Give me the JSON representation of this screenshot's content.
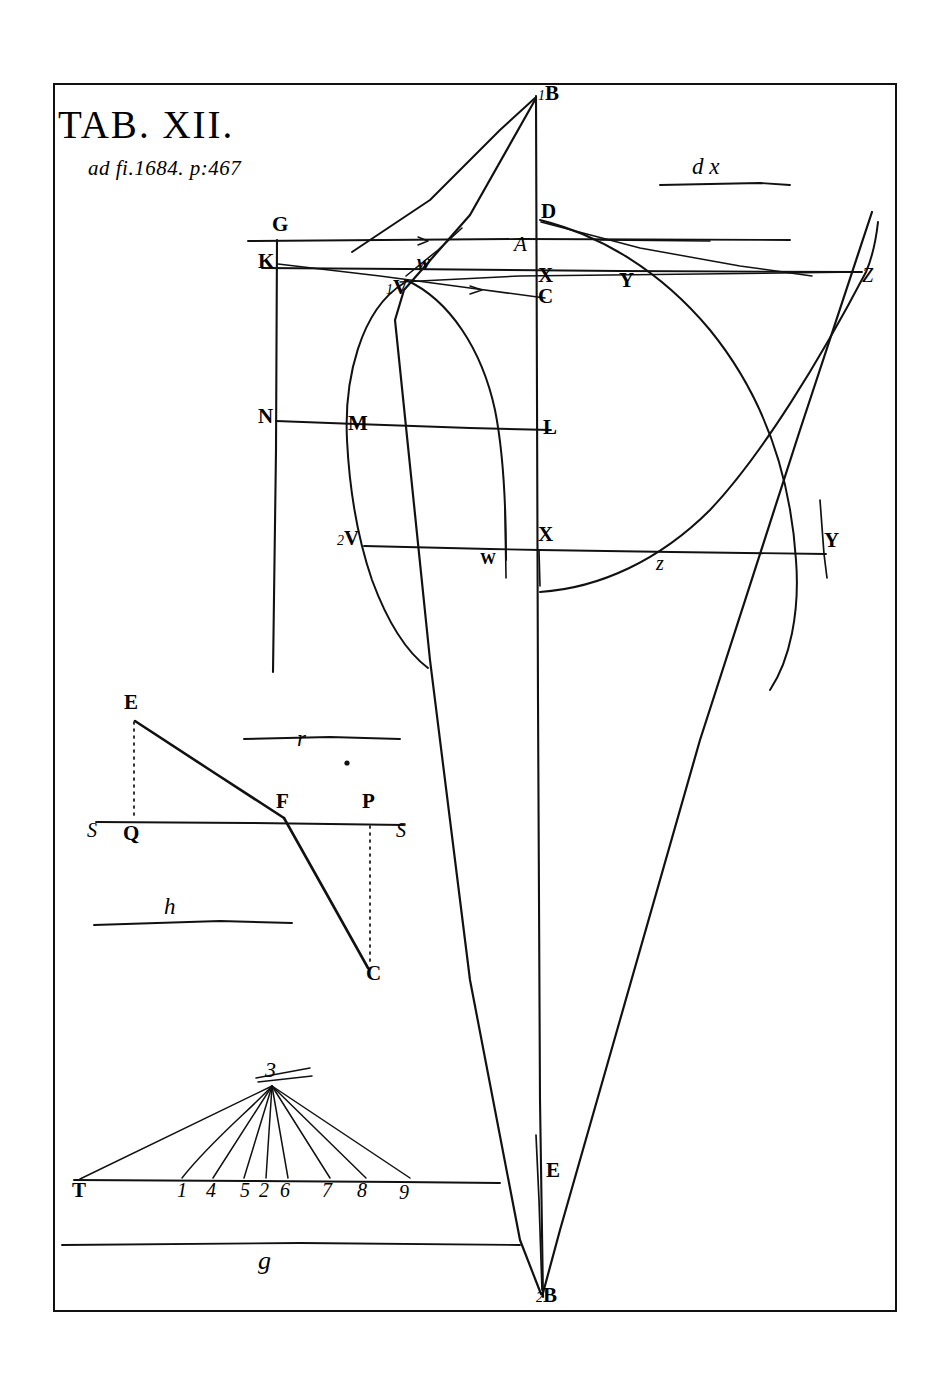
{
  "plate": {
    "title": "TAB. XII.",
    "subtitle": "ad fi.1684. p:467",
    "border_color": "#111111",
    "ink_color": "#111111",
    "background": "#ffffff"
  },
  "marginalia": [
    {
      "name": "dx",
      "text": "d x"
    },
    {
      "name": "r",
      "text": "r"
    },
    {
      "name": "h",
      "text": "h"
    },
    {
      "name": "g",
      "text": "g"
    }
  ],
  "main_figure": {
    "axis_labels": {
      "top_apex": "1B",
      "bottom_apex": "2B",
      "focus_E": "E"
    },
    "points": [
      {
        "id": "G",
        "label": "G",
        "x": 272,
        "y": 228
      },
      {
        "id": "K",
        "label": "K",
        "x": 262,
        "y": 265
      },
      {
        "id": "N",
        "label": "N",
        "x": 262,
        "y": 420
      },
      {
        "id": "D",
        "label": "D",
        "x": 545,
        "y": 215
      },
      {
        "id": "A",
        "label": "A",
        "x": 521,
        "y": 248
      },
      {
        "id": "X1",
        "label": "X",
        "x": 543,
        "y": 279
      },
      {
        "id": "C",
        "label": "C",
        "x": 543,
        "y": 300
      },
      {
        "id": "1V",
        "label": "1V",
        "prefix": "1",
        "x": 394,
        "y": 289
      },
      {
        "id": "w",
        "label": "w",
        "x": 424,
        "y": 263
      },
      {
        "id": "M",
        "label": "M",
        "x": 353,
        "y": 427
      },
      {
        "id": "L",
        "label": "L",
        "x": 546,
        "y": 430
      },
      {
        "id": "2V",
        "label": "2V",
        "prefix": "2",
        "x": 348,
        "y": 540
      },
      {
        "id": "W",
        "label": "W",
        "x": 484,
        "y": 563
      },
      {
        "id": "X2",
        "label": "X",
        "x": 543,
        "y": 538
      },
      {
        "id": "z1",
        "label": "z",
        "x": 662,
        "y": 566
      },
      {
        "id": "Y1",
        "label": "Y",
        "x": 625,
        "y": 284
      },
      {
        "id": "Y2",
        "label": "Y",
        "x": 828,
        "y": 545
      },
      {
        "id": "Z",
        "label": "Z",
        "x": 864,
        "y": 279
      }
    ]
  },
  "refraction_figure": {
    "points": [
      {
        "id": "E",
        "label": "E",
        "x": 129,
        "y": 706
      },
      {
        "id": "F",
        "label": "F",
        "x": 281,
        "y": 805
      },
      {
        "id": "P",
        "label": "P",
        "x": 367,
        "y": 805
      },
      {
        "id": "C",
        "label": "C",
        "x": 372,
        "y": 976
      },
      {
        "id": "Q",
        "label": "Q",
        "x": 129,
        "y": 836
      },
      {
        "id": "S1",
        "label": "S",
        "x": 91,
        "y": 830
      },
      {
        "id": "S2",
        "label": "S",
        "x": 399,
        "y": 830
      }
    ]
  },
  "fan_figure": {
    "apex": "3",
    "baseline_labels": [
      "T",
      "1",
      "4",
      "5",
      "2",
      "6",
      "7",
      "8",
      "9"
    ]
  }
}
